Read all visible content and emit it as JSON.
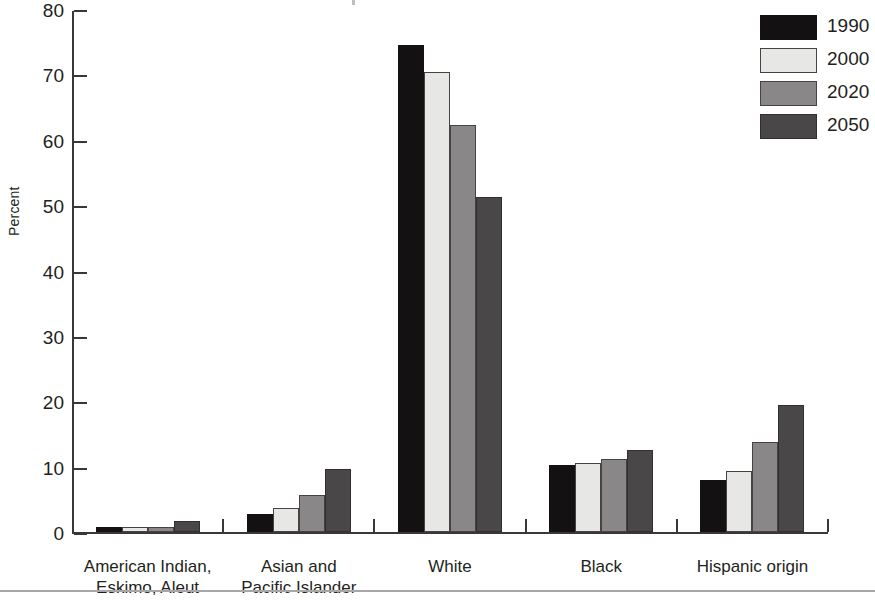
{
  "chart_data": {
    "type": "bar",
    "title": "",
    "xlabel": "",
    "ylabel": "Percent",
    "ylim": [
      0,
      80
    ],
    "yticks": [
      0,
      10,
      20,
      30,
      40,
      50,
      60,
      70,
      80
    ],
    "grid": false,
    "legend_position": "top-right",
    "categories": [
      "American Indian,\nEskimo, Aleut",
      "Asian and\nPacific Islander",
      "White",
      "Black",
      "Hispanic origin"
    ],
    "category_lines": [
      [
        "American Indian,",
        "Eskimo, Aleut"
      ],
      [
        "Asian and",
        "Pacific Islander"
      ],
      [
        "White"
      ],
      [
        "Black"
      ],
      [
        "Hispanic origin"
      ]
    ],
    "series": [
      {
        "name": "1990",
        "color": "#141112",
        "values": [
          0.8,
          2.7,
          74.5,
          10.2,
          8.0
        ]
      },
      {
        "name": "2000",
        "color": "#e7e7e5",
        "values": [
          0.7,
          3.6,
          70.3,
          10.6,
          9.3
        ]
      },
      {
        "name": "2020",
        "color": "#8a8789",
        "values": [
          0.7,
          5.6,
          62.3,
          11.1,
          13.8
        ]
      },
      {
        "name": "2050",
        "color": "#4a4749",
        "values": [
          1.7,
          9.6,
          51.3,
          12.5,
          19.4
        ]
      }
    ]
  },
  "axis": {
    "y_title": "Percent",
    "tick_labels": [
      "80",
      "70",
      "60",
      "50",
      "40",
      "30",
      "20",
      "10",
      "0"
    ]
  },
  "legend": {
    "items": [
      {
        "label": "1990",
        "swatch": "legend-swatch-1990"
      },
      {
        "label": "2000",
        "swatch": "legend-swatch-2000"
      },
      {
        "label": "2020",
        "swatch": "legend-swatch-2020"
      },
      {
        "label": "2050",
        "swatch": "legend-swatch-2050"
      }
    ]
  }
}
